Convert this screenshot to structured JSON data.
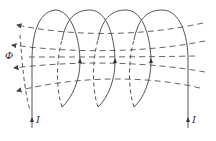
{
  "diagram": {
    "labels": {
      "flux": "Φ",
      "current_in": "I",
      "current_out": "I"
    },
    "turns": 4,
    "flux_lines": 5,
    "colors": {
      "line": "#555555",
      "background": "#ffffff"
    }
  }
}
